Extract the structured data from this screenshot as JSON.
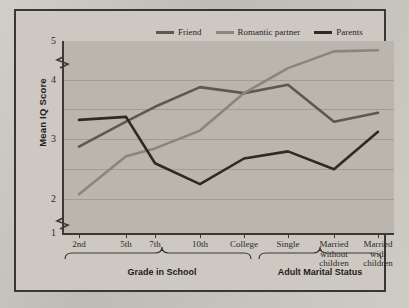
{
  "chart_data": {
    "type": "line",
    "title": "",
    "xlabel": "",
    "ylabel": "Mean IQ Score",
    "ylim": [
      1,
      5
    ],
    "yticks": [
      1,
      2,
      3,
      4,
      5
    ],
    "grid": true,
    "axis_break": true,
    "legend_position": "top",
    "categories": [
      "2nd",
      "5th",
      "7th",
      "10th",
      "College",
      "Single",
      "Married without children",
      "Married with children"
    ],
    "group_labels": [
      {
        "label": "Grade in School",
        "categories": [
          "2nd",
          "5th",
          "7th",
          "10th",
          "College"
        ]
      },
      {
        "label": "Adult Marital Status",
        "categories": [
          "Single",
          "Married without children",
          "Married with children"
        ]
      }
    ],
    "series": [
      {
        "name": "Friend",
        "color": "#5d5951",
        "values": [
          2.88,
          3.3,
          3.55,
          3.88,
          3.78,
          3.92,
          3.3,
          3.45
        ]
      },
      {
        "name": "Romantic partner",
        "color": "#8a867e",
        "values": [
          2.08,
          2.72,
          2.85,
          3.15,
          3.78,
          4.2,
          4.48,
          4.5
        ]
      },
      {
        "name": "Parents",
        "color": "#2e2b26",
        "values": [
          3.33,
          3.38,
          2.6,
          2.25,
          2.68,
          2.8,
          2.5,
          3.13
        ]
      }
    ]
  },
  "axis": {
    "y_tick_labels": [
      "5",
      "4",
      "3",
      "2",
      "1"
    ],
    "y_title": "Mean IQ Score"
  },
  "legend": {
    "items": [
      {
        "label": "Friend",
        "color": "#5d5951"
      },
      {
        "label": "Romantic partner",
        "color": "#8a867e"
      },
      {
        "label": "Parents",
        "color": "#2e2b26"
      }
    ]
  },
  "groups": {
    "left": "Grade in School",
    "right": "Adult Marital Status"
  },
  "colors": {
    "frame": "#3a3630",
    "plot_bg": "#bab6ae",
    "gridline": "#a19d96",
    "page_bg": "#c9c5be"
  }
}
